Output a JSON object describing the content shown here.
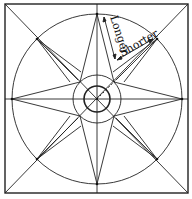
{
  "diagram": {
    "labels": {
      "longer": "Longer",
      "shorter": "Shorter"
    },
    "geometry": {
      "square": {
        "x": 5,
        "y": 4,
        "w": 183,
        "h": 189
      },
      "center": {
        "x": 97,
        "y": 99
      },
      "outer_circle_r": 85,
      "middle_circle_r": 24,
      "inner_circle_r": 13
    },
    "colors": {
      "stroke": "#222222",
      "background": "#ffffff"
    }
  }
}
